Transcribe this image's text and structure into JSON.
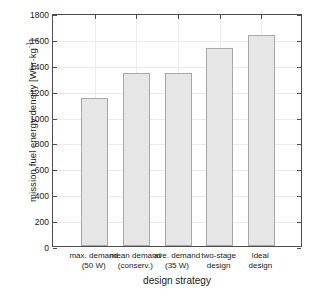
{
  "chart_data": {
    "type": "bar",
    "title": "",
    "xlabel": "design strategy",
    "ylabel": "mission fuel energy density [Whr·kg⁻¹]",
    "ylabel_main": "mission fuel energy density [Whr·kg",
    "ylabel_sup": "-1",
    "ylabel_tail": "]",
    "categories": [
      "max. demand\n(50 W)",
      "mean demand\n(conserv.)",
      "ave. demand\n(35 W)",
      "two-stage\ndesign",
      "ideal\ndesign"
    ],
    "category_lines": [
      [
        "max. demand",
        "(50 W)"
      ],
      [
        "mean demand",
        "(conserv.)"
      ],
      [
        "ave. demand",
        "(35 W)"
      ],
      [
        "two-stage",
        "design"
      ],
      [
        "ideal",
        "design"
      ]
    ],
    "values": [
      1145,
      1335,
      1340,
      1530,
      1630
    ],
    "ylim": [
      0,
      1800
    ],
    "xlim": [
      0,
      6
    ],
    "yticks": [
      0,
      200,
      400,
      600,
      800,
      1000,
      1200,
      1400,
      1600,
      1800
    ],
    "ytick_labels": [
      "0",
      "200",
      "400",
      "600",
      "800",
      "1000",
      "1200",
      "1400",
      "1600",
      "1800"
    ],
    "grid": true,
    "legend": null,
    "legend_position": "none",
    "bar_fill_color": "#e6e6e6",
    "bar_edge_color": "#a8a8a8",
    "axis_color": "#4d4d4d",
    "grid_color": "#ececec",
    "background_color": "#ffffff"
  }
}
